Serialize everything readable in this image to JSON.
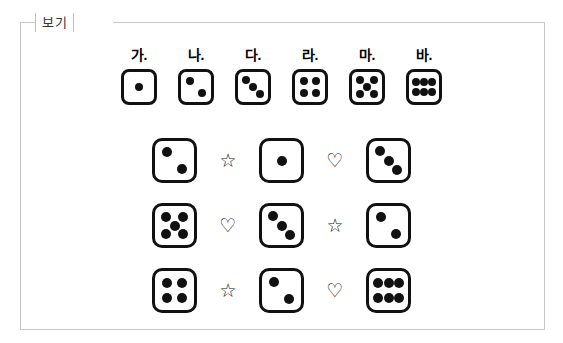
{
  "frame": {
    "caption": "보기",
    "border_color": "#c9c9c9",
    "background": "#ffffff"
  },
  "style": {
    "die_border_color": "#111111",
    "pip_color": "#111111"
  },
  "reference": {
    "items": [
      {
        "label": "가.",
        "value": 1,
        "pattern": "center"
      },
      {
        "label": "나.",
        "value": 2,
        "pattern": "diagonal"
      },
      {
        "label": "다.",
        "value": 3,
        "pattern": "diagonal"
      },
      {
        "label": "라.",
        "value": 4,
        "pattern": "corners"
      },
      {
        "label": "마.",
        "value": 5,
        "pattern": "quincunx"
      },
      {
        "label": "바.",
        "value": 6,
        "pattern": "two-rows-of-three"
      }
    ]
  },
  "equations": {
    "rows": [
      {
        "cells": [
          {
            "kind": "die",
            "value": 2
          },
          {
            "kind": "symbol",
            "name": "star-outline",
            "glyph": "☆"
          },
          {
            "kind": "die",
            "value": 1
          },
          {
            "kind": "symbol",
            "name": "heart-outline",
            "glyph": "♡"
          },
          {
            "kind": "die",
            "value": 3
          }
        ]
      },
      {
        "cells": [
          {
            "kind": "die",
            "value": 5
          },
          {
            "kind": "symbol",
            "name": "heart-outline",
            "glyph": "♡"
          },
          {
            "kind": "die",
            "value": 3
          },
          {
            "kind": "symbol",
            "name": "star-outline",
            "glyph": "☆"
          },
          {
            "kind": "die",
            "value": 2
          }
        ]
      },
      {
        "cells": [
          {
            "kind": "die",
            "value": 4
          },
          {
            "kind": "symbol",
            "name": "star-outline",
            "glyph": "☆"
          },
          {
            "kind": "die",
            "value": 2
          },
          {
            "kind": "symbol",
            "name": "heart-outline",
            "glyph": "♡"
          },
          {
            "kind": "die",
            "value": 6
          }
        ]
      }
    ]
  }
}
